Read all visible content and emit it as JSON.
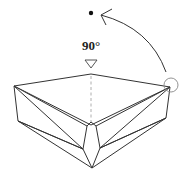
{
  "diagram": {
    "type": "origami-fold-step",
    "angle_label": "90°",
    "colors": {
      "stroke": "#333333",
      "dashed": "#999999",
      "circle": "#888888",
      "background": "#ffffff"
    },
    "annotations": {
      "rotation_arrow": "curved arrow from right corner toward dot, indicating lift/rotate",
      "target_dot": "dot marking destination point",
      "fold_marker": "hollow down-pointing triangle above center crease",
      "corner_circle": "circle highlighting right corner",
      "center_crease": "dashed vertical valley line"
    }
  }
}
